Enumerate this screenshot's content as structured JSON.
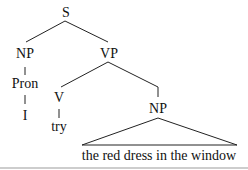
{
  "tree": {
    "root": "S",
    "subject_np": "NP",
    "pronoun_category": "Pron",
    "pronoun": "I",
    "vp": "VP",
    "verb_category": "V",
    "verb": "try",
    "object_np": "NP",
    "object_phrase": "the red dress in the window"
  }
}
